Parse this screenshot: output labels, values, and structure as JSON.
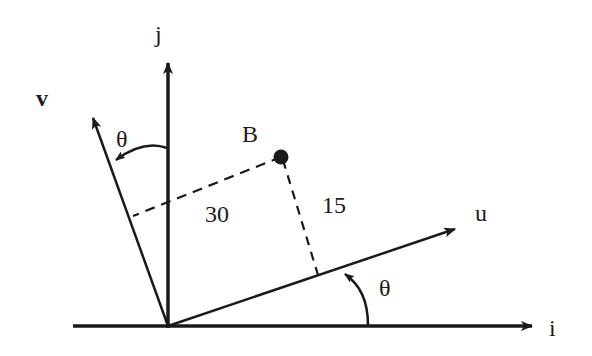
{
  "diagram": {
    "axes": {
      "i_label": "i",
      "j_label": "j"
    },
    "rotated_axes": {
      "u_label": "u",
      "v_label": "v"
    },
    "angle_label_u": "θ",
    "angle_label_v": "θ",
    "point": {
      "label": "B",
      "u_coordinate_label": "30",
      "v_coordinate_label": "15"
    },
    "colors": {
      "ink": "#1a1a1a",
      "background": "#ffffff"
    }
  }
}
